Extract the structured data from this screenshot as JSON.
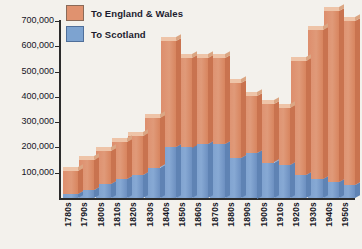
{
  "chart_data": {
    "type": "bar",
    "title": "",
    "subtitle": "",
    "xlabel": "",
    "ylabel": "",
    "stacked": true,
    "grid": false,
    "legend_position": "top-left",
    "ylim": [
      0,
      700000
    ],
    "ytick_values": [
      100000,
      200000,
      300000,
      400000,
      500000,
      600000,
      700000
    ],
    "ytick_labels": [
      "100,000",
      "200,000",
      "300,000",
      "400,000",
      "500,000",
      "600,000",
      "700,000"
    ],
    "categories": [
      "1780s",
      "1790s",
      "1800s",
      "1810s",
      "1820s",
      "1830s",
      "1840s",
      "1850s",
      "1860s",
      "1870s",
      "1880s",
      "1890s",
      "1900s",
      "1910s",
      "1920s",
      "1930s",
      "1940s",
      "1950s"
    ],
    "series": [
      {
        "name": "To Scotland",
        "color": "#7da3d0",
        "values": [
          15000,
          30000,
          55000,
          75000,
          90000,
          120000,
          200000,
          200000,
          215000,
          215000,
          160000,
          180000,
          140000,
          130000,
          90000,
          75000,
          65000,
          50000
        ]
      },
      {
        "name": "To England & Wales",
        "color": "#e0926f",
        "values": [
          90000,
          120000,
          130000,
          145000,
          155000,
          195000,
          420000,
          355000,
          340000,
          340000,
          295000,
          225000,
          230000,
          225000,
          450000,
          590000,
          675000,
          650000
        ]
      }
    ],
    "totals": [
      105000,
      150000,
      185000,
      220000,
      245000,
      315000,
      620000,
      555000,
      555000,
      555000,
      455000,
      405000,
      370000,
      355000,
      540000,
      665000,
      740000,
      700000
    ]
  },
  "legend": {
    "items": [
      {
        "label": "To England & Wales",
        "swatch_color": "#e0926f"
      },
      {
        "label": "To Scotland",
        "swatch_color": "#7da3d0"
      }
    ]
  }
}
